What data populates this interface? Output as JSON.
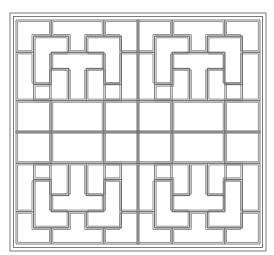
{
  "image": {
    "title": "Geometric lattice pattern",
    "description": "Square line-art lattice of interlocking L and T shapes in four mirrored quadrants, double-line outlines, double frame border",
    "colors": {
      "background": "#ffffff",
      "line": "#6e6e6e"
    },
    "frame": {
      "outer": {
        "x": 10,
        "y": 13,
        "w": 256,
        "h": 238
      },
      "inner": {
        "x": 14,
        "y": 17,
        "w": 248,
        "h": 230
      }
    },
    "quadrant": {
      "origin_x": 17,
      "origin_y": 21,
      "unit_x": 17.2,
      "unit_y": 16,
      "count": 4
    }
  }
}
